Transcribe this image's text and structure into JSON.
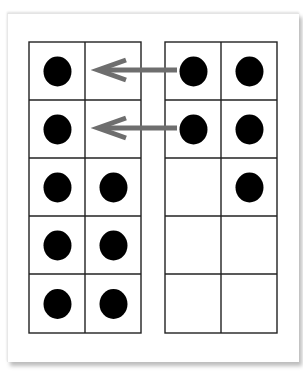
{
  "figure": {
    "colors": {
      "background": "#ffffff",
      "grid_line": "#222222",
      "counter": "#000000",
      "arrow": "#6e6e6e",
      "card_shadow": "#bdbdbd"
    },
    "left_frame": {
      "rows": 5,
      "cols": 2,
      "cells": [
        [
          true,
          false
        ],
        [
          true,
          false
        ],
        [
          true,
          true
        ],
        [
          true,
          true
        ],
        [
          true,
          true
        ]
      ],
      "counter_count": 8
    },
    "right_frame": {
      "rows": 5,
      "cols": 2,
      "cells": [
        [
          true,
          true
        ],
        [
          true,
          true
        ],
        [
          false,
          true
        ],
        [
          false,
          false
        ],
        [
          false,
          false
        ]
      ],
      "counter_count": 5
    },
    "arrows": [
      {
        "from": "right_frame row 1 col 1",
        "to": "left_frame row 1 col 2",
        "direction": "left"
      },
      {
        "from": "right_frame row 2 col 1",
        "to": "left_frame row 2 col 2",
        "direction": "left"
      }
    ]
  }
}
